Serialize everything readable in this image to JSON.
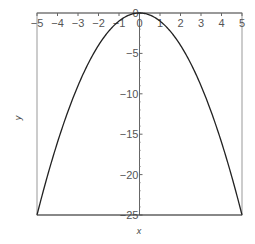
{
  "chart_data": {
    "type": "line",
    "title": "",
    "xlabel": "x",
    "ylabel": "y",
    "xlim": [
      -5,
      5
    ],
    "ylim": [
      -25,
      0
    ],
    "xticks": [
      -5,
      -4,
      -3,
      -2,
      -1,
      0,
      1,
      2,
      3,
      4,
      5
    ],
    "xtick_labels": [
      "−5",
      "−4",
      "−3",
      "−2",
      "−1",
      "0",
      "1",
      "2",
      "3",
      "4",
      "5"
    ],
    "yticks": [
      0,
      -5,
      -10,
      -15,
      -20,
      -25
    ],
    "ytick_labels": [
      "0",
      "−5",
      "−10",
      "−15",
      "−20",
      "−25"
    ],
    "grid": false,
    "legend": null,
    "series": [
      {
        "name": "y = -x^2",
        "x": [
          -5,
          -4.5,
          -4,
          -3.5,
          -3,
          -2.5,
          -2,
          -1.5,
          -1,
          -0.5,
          0,
          0.5,
          1,
          1.5,
          2,
          2.5,
          3,
          3.5,
          4,
          4.5,
          5
        ],
        "y": [
          -25,
          -20.25,
          -16,
          -12.25,
          -9,
          -6.25,
          -4,
          -2.25,
          -1,
          -0.25,
          0,
          -0.25,
          -1,
          -2.25,
          -4,
          -6.25,
          -9,
          -12.25,
          -16,
          -20.25,
          -25
        ],
        "color": "#222222"
      }
    ]
  },
  "colors": {
    "frame": "#888888",
    "curve": "#222222",
    "axis": "#666666"
  }
}
